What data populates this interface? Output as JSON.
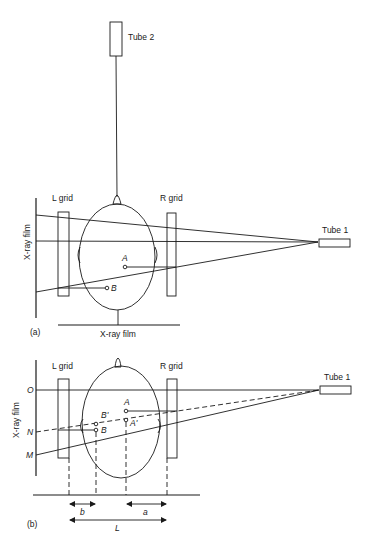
{
  "figure": {
    "panel_a": {
      "caption": "(a)",
      "tube2_label": "Tube 2",
      "tube1_label": "Tube 1",
      "left_grid_label": "L grid",
      "right_grid_label": "R grid",
      "side_film_label": "X-ray film",
      "bottom_film_label": "X-ray film",
      "point_a": "A",
      "point_b": "B"
    },
    "panel_b": {
      "caption": "(b)",
      "tube1_label": "Tube 1",
      "left_grid_label": "L grid",
      "right_grid_label": "R grid",
      "side_film_label": "X-ray film",
      "film_point_o": "O",
      "film_point_n": "N",
      "film_point_m": "M",
      "point_a": "A",
      "point_a_prime": "A'",
      "point_b": "B",
      "point_b_prime": "B'",
      "dimension_b": "b",
      "dimension_a": "a",
      "dimension_l": "L"
    }
  }
}
